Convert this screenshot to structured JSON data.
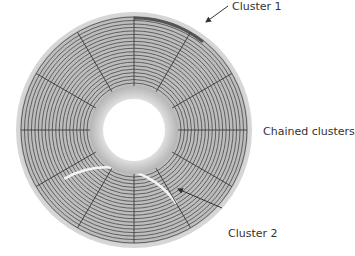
{
  "diagram": {
    "type": "disk-platter",
    "colors": {
      "background": "#ffffff",
      "platter_fill": "#bdbdbd",
      "platter_rim": "#d6d6d6",
      "track_line": "#555555",
      "sector_line": "#3a3a3a",
      "hub_fill": "#c8c8c8",
      "hole_fill": "#ffffff",
      "cluster1_color": "#555555",
      "cluster2_color": "#f4f4f4",
      "arrow_color": "#333333",
      "text_color": "#333333"
    },
    "geometry": {
      "center_x": 134,
      "center_y": 130,
      "outer_radius": 118,
      "track_outer_radius": 113,
      "track_inner_radius": 47,
      "track_count": 20,
      "hub_radius": 44,
      "hole_radius": 31,
      "sector_count": 12
    },
    "labels": [
      {
        "id": "cluster1",
        "text": "Cluster 1"
      },
      {
        "id": "chained",
        "text": "Chained clusters"
      },
      {
        "id": "cluster2",
        "text": "Cluster 2"
      }
    ]
  }
}
